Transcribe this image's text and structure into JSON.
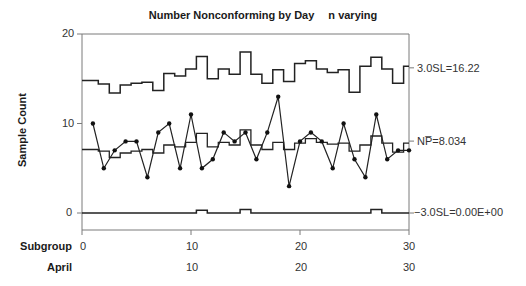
{
  "chart_data": {
    "type": "line",
    "chart_kind": "np control chart (varying n)",
    "title": "Number Nonconforming by Day",
    "subtitle": "n varying",
    "xlabel": "Subgroup",
    "ylabel": "Sample Count",
    "secondary_xlabel": "April",
    "ylim": [
      -3,
      20
    ],
    "xlim": [
      0,
      30
    ],
    "y_ticks": [
      0,
      10,
      20
    ],
    "x_ticks": [
      0,
      10,
      20,
      30
    ],
    "secondary_x_ticks": [
      10,
      20,
      30
    ],
    "grid": false,
    "x": [
      1,
      2,
      3,
      4,
      5,
      6,
      7,
      8,
      9,
      10,
      11,
      12,
      13,
      14,
      15,
      16,
      17,
      18,
      19,
      20,
      21,
      22,
      23,
      24,
      25,
      26,
      27,
      28,
      29,
      30
    ],
    "series": [
      {
        "name": "Number Nonconforming",
        "style": "line-markers",
        "values": [
          10,
          5,
          7,
          8,
          8,
          4,
          9,
          10,
          5,
          11,
          5,
          6,
          9,
          8,
          9,
          6,
          9,
          13,
          3,
          8,
          9,
          8,
          5,
          10,
          6,
          4,
          11,
          6,
          7,
          7
        ]
      },
      {
        "name": "Center Line (NP-bar, step)",
        "style": "step",
        "values": [
          7.1,
          6.9,
          6.2,
          6.7,
          6.9,
          7.1,
          6.7,
          7.6,
          7.4,
          7.9,
          8.9,
          7.4,
          7.9,
          7.6,
          9.3,
          7.6,
          7.1,
          7.9,
          7.1,
          7.8,
          8.3,
          7.9,
          7.7,
          7.8,
          6.9,
          7.6,
          8.6,
          7.8,
          6.8,
          7.8
        ]
      },
      {
        "name": "UCL (3.0SL, step)",
        "style": "step",
        "values": [
          14.8,
          14.4,
          13.4,
          14.3,
          14.5,
          14.6,
          13.7,
          15.6,
          15.3,
          16.1,
          17.5,
          15.0,
          16.1,
          15.5,
          18.0,
          15.5,
          14.5,
          16.0,
          14.7,
          16.7,
          17.0,
          16.1,
          15.7,
          16.0,
          13.5,
          16.4,
          17.4,
          16.1,
          14.5,
          16.4
        ]
      },
      {
        "name": "LCL (-3.0SL, step)",
        "style": "step",
        "values": [
          0,
          0,
          0,
          0,
          0,
          0,
          0,
          0,
          0,
          0,
          0.3,
          0,
          0,
          0,
          0.4,
          0,
          0,
          0,
          0,
          0,
          0,
          0,
          0,
          0,
          0,
          0,
          0.4,
          0,
          0,
          0
        ]
      }
    ],
    "annotations": [
      {
        "text": "3.0SL=16.22",
        "y": 16.22
      },
      {
        "text": "NP̅=8.034",
        "y": 8.034
      },
      {
        "text": "−3.0SL=0.00E+00",
        "y": 0
      }
    ]
  },
  "labels": {
    "title_main": "Number Nonconforming by Day",
    "title_sub": "n varying",
    "ylabel": "Sample Count",
    "xlabel": "Subgroup",
    "secondary_xlabel": "April",
    "ytick_0": "0",
    "ytick_10": "10",
    "ytick_20": "20",
    "xtick_0": "0",
    "xtick_10": "10",
    "xtick_20": "20",
    "xtick_30": "30",
    "april_10": "10",
    "april_20": "20",
    "april_30": "30",
    "ucl": "3.0SL=16.22",
    "center": "NP̅=8.034",
    "lcl": "−3.0SL=0.00E+00"
  }
}
